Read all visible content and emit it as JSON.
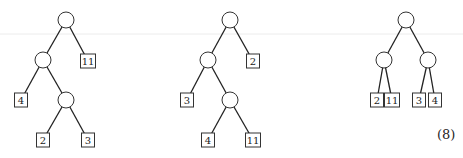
{
  "trees": [
    {
      "name": "tree-1",
      "nodes": [
        {
          "id": "r",
          "type": "internal"
        },
        {
          "id": "a",
          "type": "internal",
          "parent": "r"
        },
        {
          "id": "l11",
          "type": "leaf",
          "label": "11",
          "parent": "r"
        },
        {
          "id": "l4",
          "type": "leaf",
          "label": "4",
          "parent": "a"
        },
        {
          "id": "b",
          "type": "internal",
          "parent": "a"
        },
        {
          "id": "l2",
          "type": "leaf",
          "label": "2",
          "parent": "b"
        },
        {
          "id": "l3",
          "type": "leaf",
          "label": "3",
          "parent": "b"
        }
      ]
    },
    {
      "name": "tree-2",
      "nodes": [
        {
          "id": "r",
          "type": "internal"
        },
        {
          "id": "a",
          "type": "internal",
          "parent": "r"
        },
        {
          "id": "l2",
          "type": "leaf",
          "label": "2",
          "parent": "r"
        },
        {
          "id": "l3",
          "type": "leaf",
          "label": "3",
          "parent": "a"
        },
        {
          "id": "b",
          "type": "internal",
          "parent": "a"
        },
        {
          "id": "l4",
          "type": "leaf",
          "label": "4",
          "parent": "b"
        },
        {
          "id": "l11",
          "type": "leaf",
          "label": "11",
          "parent": "b"
        }
      ]
    },
    {
      "name": "tree-3",
      "nodes": [
        {
          "id": "r",
          "type": "internal"
        },
        {
          "id": "a",
          "type": "internal",
          "parent": "r"
        },
        {
          "id": "b",
          "type": "internal",
          "parent": "r"
        },
        {
          "id": "l2",
          "type": "leaf",
          "label": "2",
          "parent": "a"
        },
        {
          "id": "l11",
          "type": "leaf",
          "label": "11",
          "parent": "a"
        },
        {
          "id": "l3",
          "type": "leaf",
          "label": "3",
          "parent": "b"
        },
        {
          "id": "l4",
          "type": "leaf",
          "label": "4",
          "parent": "b"
        }
      ]
    }
  ],
  "equation_label": "(8)"
}
